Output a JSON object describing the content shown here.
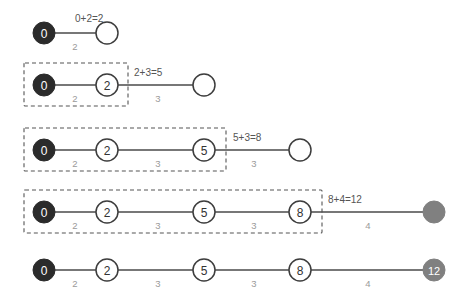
{
  "diagram": {
    "colors": {
      "source_node_fill": "#2b2b2b",
      "settled_node_fill": "#ffffff",
      "final_node_fill": "#808080",
      "edge_stroke": "#4a4a4a",
      "edge_weight_text": "#9a9a9a",
      "sum_label_text": "#555555",
      "visited_box_stroke": "#555555",
      "background": "#ffffff"
    },
    "geometry": {
      "width": 463,
      "height": 298,
      "columns": [
        44,
        107,
        204,
        300,
        434
      ],
      "row_centers": [
        33,
        85,
        150,
        212,
        270
      ],
      "node_radius_filled": 11,
      "node_radius_open": 11
    },
    "rows": [
      {
        "id": "step-1",
        "sum_label": "0+2=2",
        "sum_label_x": 75,
        "sum_label_y": 18,
        "cy": 33,
        "has_visited_box": false,
        "visited_box": null,
        "nodes": [
          {
            "id": "n0",
            "label": "0",
            "cx": 44,
            "style": "dark"
          },
          {
            "id": "n1",
            "label": "",
            "cx": 107,
            "style": "open-empty"
          }
        ],
        "edges": [
          {
            "from_x": 55,
            "to_x": 96,
            "weight": "2",
            "weight_x": 75,
            "weight_y": 46
          }
        ]
      },
      {
        "id": "step-2",
        "sum_label": "2+3=5",
        "sum_label_x": 134,
        "sum_label_y": 72,
        "cy": 85,
        "has_visited_box": true,
        "visited_box": {
          "x": 24,
          "y": 63,
          "width": 104,
          "height": 43
        },
        "nodes": [
          {
            "id": "n0",
            "label": "0",
            "cx": 44,
            "style": "dark"
          },
          {
            "id": "n1",
            "label": "2",
            "cx": 107,
            "style": "open"
          },
          {
            "id": "n2",
            "label": "",
            "cx": 204,
            "style": "open-empty"
          }
        ],
        "edges": [
          {
            "from_x": 55,
            "to_x": 96,
            "weight": "2",
            "weight_x": 75,
            "weight_y": 98
          },
          {
            "from_x": 118,
            "to_x": 193,
            "weight": "3",
            "weight_x": 158,
            "weight_y": 98
          }
        ]
      },
      {
        "id": "step-3",
        "sum_label": "5+3=8",
        "sum_label_x": 233,
        "sum_label_y": 137,
        "cy": 150,
        "has_visited_box": true,
        "visited_box": {
          "x": 24,
          "y": 128,
          "width": 202,
          "height": 43
        },
        "nodes": [
          {
            "id": "n0",
            "label": "0",
            "cx": 44,
            "style": "dark"
          },
          {
            "id": "n1",
            "label": "2",
            "cx": 107,
            "style": "open"
          },
          {
            "id": "n2",
            "label": "5",
            "cx": 204,
            "style": "open"
          },
          {
            "id": "n3",
            "label": "",
            "cx": 300,
            "style": "open-empty"
          }
        ],
        "edges": [
          {
            "from_x": 55,
            "to_x": 96,
            "weight": "2",
            "weight_x": 75,
            "weight_y": 163
          },
          {
            "from_x": 118,
            "to_x": 193,
            "weight": "3",
            "weight_x": 158,
            "weight_y": 163
          },
          {
            "from_x": 215,
            "to_x": 289,
            "weight": "3",
            "weight_x": 254,
            "weight_y": 163
          }
        ]
      },
      {
        "id": "step-4",
        "sum_label": "8+4=12",
        "sum_label_x": 328,
        "sum_label_y": 199,
        "cy": 212,
        "has_visited_box": true,
        "visited_box": {
          "x": 24,
          "y": 190,
          "width": 298,
          "height": 43
        },
        "nodes": [
          {
            "id": "n0",
            "label": "0",
            "cx": 44,
            "style": "dark"
          },
          {
            "id": "n1",
            "label": "2",
            "cx": 107,
            "style": "open"
          },
          {
            "id": "n2",
            "label": "5",
            "cx": 204,
            "style": "open"
          },
          {
            "id": "n3",
            "label": "8",
            "cx": 300,
            "style": "open"
          },
          {
            "id": "n4",
            "label": "",
            "cx": 434,
            "style": "gray-empty"
          }
        ],
        "edges": [
          {
            "from_x": 55,
            "to_x": 96,
            "weight": "2",
            "weight_x": 75,
            "weight_y": 225
          },
          {
            "from_x": 118,
            "to_x": 193,
            "weight": "3",
            "weight_x": 158,
            "weight_y": 225
          },
          {
            "from_x": 215,
            "to_x": 289,
            "weight": "3",
            "weight_x": 254,
            "weight_y": 225
          },
          {
            "from_x": 311,
            "to_x": 423,
            "weight": "4",
            "weight_x": 368,
            "weight_y": 225
          }
        ]
      },
      {
        "id": "step-5",
        "sum_label": "",
        "sum_label_x": 0,
        "sum_label_y": 0,
        "cy": 270,
        "has_visited_box": false,
        "visited_box": null,
        "nodes": [
          {
            "id": "n0",
            "label": "0",
            "cx": 44,
            "style": "dark"
          },
          {
            "id": "n1",
            "label": "2",
            "cx": 107,
            "style": "open"
          },
          {
            "id": "n2",
            "label": "5",
            "cx": 204,
            "style": "open"
          },
          {
            "id": "n3",
            "label": "8",
            "cx": 300,
            "style": "open"
          },
          {
            "id": "n4",
            "label": "12",
            "cx": 434,
            "style": "gray"
          }
        ],
        "edges": [
          {
            "from_x": 55,
            "to_x": 96,
            "weight": "2",
            "weight_x": 75,
            "weight_y": 283
          },
          {
            "from_x": 118,
            "to_x": 193,
            "weight": "3",
            "weight_x": 158,
            "weight_y": 283
          },
          {
            "from_x": 215,
            "to_x": 289,
            "weight": "3",
            "weight_x": 254,
            "weight_y": 283
          },
          {
            "from_x": 311,
            "to_x": 423,
            "weight": "4",
            "weight_x": 368,
            "weight_y": 283
          }
        ]
      }
    ]
  }
}
